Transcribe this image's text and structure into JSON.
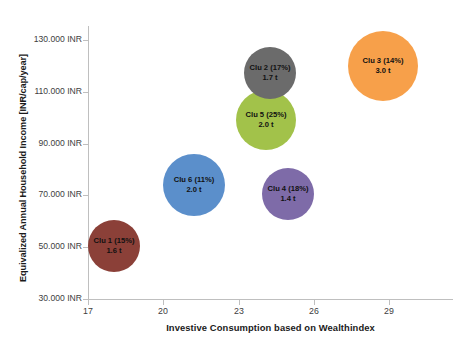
{
  "chart_data": {
    "type": "scatter",
    "title": "",
    "xlabel": "Investive Consumption based on Wealthindex",
    "ylabel": "Equivalized Annual  Household Income [INR/cap/year]",
    "xlim": [
      17,
      30.2
    ],
    "ylim": [
      30000,
      136000
    ],
    "grid": false,
    "legend": "none",
    "xticks": [
      "17",
      "20",
      "23",
      "26",
      "29"
    ],
    "xtick_values": [
      17,
      20,
      23,
      26,
      29
    ],
    "yticks": [
      "130.000 INR",
      "110.000 INR",
      "90.000 INR",
      "70.000 INR",
      "50.000 INR",
      "30.000 INR"
    ],
    "ytick_values": [
      130000,
      110000,
      90000,
      70000,
      50000,
      30000
    ],
    "bubbles": [
      {
        "name": "Clu 1 (15%)",
        "value": "1.6 t",
        "x": 18.0,
        "y": 50500,
        "size_t": 1.6,
        "share_pct": 15,
        "color": "#8B4038",
        "px": {
          "cx": 114,
          "cy": 246,
          "r": 26
        }
      },
      {
        "name": "Clu 6 (11%)",
        "value": "2.0 t",
        "x": 21.2,
        "y": 74000,
        "size_t": 2.0,
        "share_pct": 11,
        "color": "#5B8FCB",
        "px": {
          "cx": 194,
          "cy": 185,
          "r": 31
        }
      },
      {
        "name": "Clu 5 (25%)",
        "value": "2.0 t",
        "x": 24.1,
        "y": 99000,
        "size_t": 2.0,
        "share_pct": 25,
        "color": "#A2C24A",
        "px": {
          "cx": 266,
          "cy": 120,
          "r": 30
        }
      },
      {
        "name": "Clu 2 (17%)",
        "value": "1.7 t",
        "x": 24.2,
        "y": 117000,
        "size_t": 1.7,
        "share_pct": 17,
        "color": "#6B6B6B",
        "px": {
          "cx": 270,
          "cy": 73,
          "r": 26
        }
      },
      {
        "name": "Clu 4 (18%)",
        "value": "1.4 t",
        "x": 25.0,
        "y": 70500,
        "size_t": 1.4,
        "share_pct": 18,
        "color": "#7E6BA8",
        "px": {
          "cx": 288,
          "cy": 194,
          "r": 26
        }
      },
      {
        "name": "Clu 3 (14%)",
        "value": "3.0 t",
        "x": 28.8,
        "y": 120000,
        "size_t": 3.0,
        "share_pct": 14,
        "color": "#F7A04A",
        "px": {
          "cx": 383,
          "cy": 66,
          "r": 35
        }
      }
    ]
  },
  "axes": {
    "y_title": "Equivalized Annual  Household Income [INR/cap/year]",
    "x_title": "Investive Consumption based on Wealthindex"
  }
}
